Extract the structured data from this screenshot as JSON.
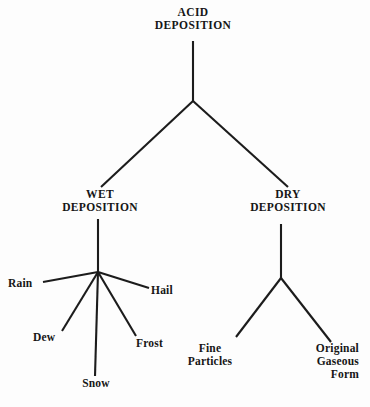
{
  "diagram": {
    "type": "hierarchy-tree",
    "title": "ACID DEPOSITION",
    "style": {
      "line_color": "#1c1c1c",
      "text_color": "#161616",
      "background": "#fdfdfd"
    },
    "root": {
      "label": "ACID\nDEPOSITION"
    },
    "level2": [
      {
        "label": "WET\nDEPOSITION"
      },
      {
        "label": "DRY\nDEPOSITION"
      }
    ],
    "wet_children": [
      {
        "label": "Rain"
      },
      {
        "label": "Dew"
      },
      {
        "label": "Snow"
      },
      {
        "label": "Frost"
      },
      {
        "label": "Hail"
      }
    ],
    "dry_children": [
      {
        "label": "Fine\nParticles"
      },
      {
        "label": "Original\nGaseous\nForm"
      }
    ]
  }
}
